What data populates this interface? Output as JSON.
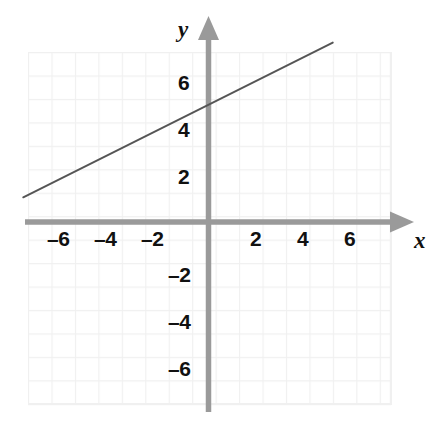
{
  "chart_data": {
    "type": "line",
    "title": "",
    "subtitle": "",
    "xlabel": "x",
    "ylabel": "y",
    "grid": true,
    "legend": "none",
    "xlim": [
      -8.5,
      7.8
    ],
    "ylim": [
      -7.8,
      7.9
    ],
    "x_ticks": [
      -6,
      -4,
      -2,
      2,
      4,
      6
    ],
    "y_ticks": [
      6,
      4,
      2,
      -2,
      -4,
      -6
    ],
    "x_tick_labels": [
      "–6",
      "–4",
      "–2",
      "2",
      "4",
      "6"
    ],
    "y_tick_labels": [
      "6",
      "4",
      "2",
      "–2",
      "–4",
      "–6"
    ],
    "grid_step": 1,
    "series": [
      {
        "name": "line",
        "equation": "y = 0.5x + 5",
        "slope": 0.5,
        "intercept": 5,
        "x": [
          -7.9,
          5.3
        ],
        "values": [
          1.05,
          7.65
        ],
        "color": "#555555"
      }
    ],
    "annotations": []
  },
  "axes": {
    "x_axis_name": "x",
    "y_axis_name": "y",
    "axis_color": "#9a9a9a",
    "grid_color": "#f0f0f0",
    "label_color": "#111111",
    "line_color": "#555555",
    "background": "#ffffff"
  },
  "x_tick_labels": [
    {
      "text": "–6",
      "value": -6
    },
    {
      "text": "–4",
      "value": -4
    },
    {
      "text": "–2",
      "value": -2
    },
    {
      "text": "2",
      "value": 2
    },
    {
      "text": "4",
      "value": 4
    },
    {
      "text": "6",
      "value": 6
    }
  ],
  "y_tick_labels": [
    {
      "text": "6",
      "value": 6
    },
    {
      "text": "4",
      "value": 4
    },
    {
      "text": "2",
      "value": 2
    },
    {
      "text": "–2",
      "value": -2
    },
    {
      "text": "–4",
      "value": -4
    },
    {
      "text": "–6",
      "value": -6
    }
  ]
}
